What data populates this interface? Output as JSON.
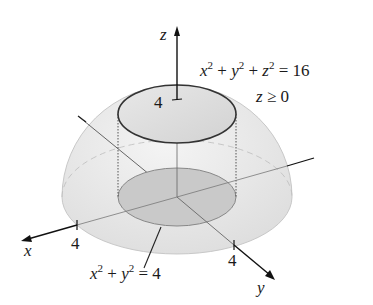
{
  "figure": {
    "type": "3d-surface-diagram",
    "surfaces": [
      "hemisphere",
      "cylinder"
    ],
    "axes": {
      "x": {
        "label": "x",
        "tick": "4"
      },
      "y": {
        "label": "y",
        "tick": "4"
      },
      "z": {
        "label": "z",
        "tick": "4"
      }
    },
    "annotations": {
      "sphere_eq": {
        "v1": "x",
        "e1": "2",
        "plus1": " + ",
        "v2": "y",
        "e2": "2",
        "plus2": " + ",
        "v3": "z",
        "e3": "2",
        "rhs": " = 16"
      },
      "constraint": {
        "var": "z",
        "rel": " ≥ 0"
      },
      "cylinder_eq": {
        "v1": "x",
        "e1": "2",
        "plus": " + ",
        "v2": "y",
        "e2": "2",
        "rhs": " = 4"
      }
    },
    "colors": {
      "hemisphere_fill": "#e6e6e6",
      "disk_fill": "#cfcfcf",
      "line": "#222222"
    }
  }
}
